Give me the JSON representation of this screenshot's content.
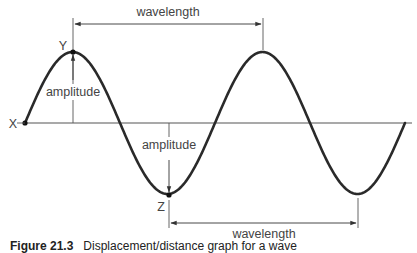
{
  "diagram": {
    "points": {
      "start": {
        "label": "X",
        "x": 25,
        "y": 123
      },
      "crest": {
        "label": "Y",
        "x": 73,
        "y": 52
      },
      "trough": {
        "label": "Z",
        "x": 169,
        "y": 195
      }
    },
    "labels": {
      "wavelength_top": "wavelength",
      "wavelength_bottom": "wavelength",
      "amplitude_crest": "amplitude",
      "amplitude_trough": "amplitude"
    },
    "wave": {
      "baseline_y": 123,
      "amplitude_px": 71,
      "half_wavelength_px": 95,
      "start_x": 25,
      "end_x": 405
    },
    "colors": {
      "wave": "#2a2a2a",
      "axis": "#555555",
      "annotation": "#444444"
    }
  },
  "caption": {
    "figure_number": "Figure 21.3",
    "text": "Displacement/distance graph for a wave"
  }
}
